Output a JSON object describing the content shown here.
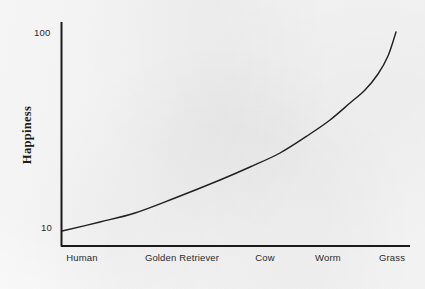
{
  "chart_data": {
    "type": "line",
    "title": "",
    "xlabel": "",
    "ylabel": "Happiness",
    "y_scale": "log",
    "ylim": [
      10,
      100
    ],
    "ytick_labels": [
      "100",
      "10"
    ],
    "ytick_values": [
      100,
      10
    ],
    "grid": false,
    "legend": false,
    "categories": [
      "Human",
      "Golden Retriever",
      "Cow",
      "Worm",
      "Grass"
    ],
    "series": [
      {
        "name": "Happiness",
        "values": [
          10,
          13,
          22,
          38,
          100
        ],
        "color": "#1f1f1f"
      }
    ],
    "curve_points": [
      {
        "x": 62,
        "y": 231
      },
      {
        "x": 100,
        "y": 222
      },
      {
        "x": 135,
        "y": 213
      },
      {
        "x": 175,
        "y": 198
      },
      {
        "x": 220,
        "y": 180
      },
      {
        "x": 250,
        "y": 167
      },
      {
        "x": 280,
        "y": 153
      },
      {
        "x": 310,
        "y": 134
      },
      {
        "x": 330,
        "y": 120
      },
      {
        "x": 350,
        "y": 103
      },
      {
        "x": 365,
        "y": 90
      },
      {
        "x": 378,
        "y": 74
      },
      {
        "x": 388,
        "y": 56
      },
      {
        "x": 396,
        "y": 32
      }
    ],
    "annotations": []
  },
  "axes": {
    "y_title": "Happiness",
    "y_ticks": [
      {
        "label": "100",
        "id": "tick-100"
      },
      {
        "label": "10",
        "id": "tick-10"
      }
    ],
    "x_ticks": [
      {
        "label": "Human",
        "x": 82
      },
      {
        "label": "Golden Retriever",
        "x": 182
      },
      {
        "label": "Cow",
        "x": 265
      },
      {
        "label": "Worm",
        "x": 328
      },
      {
        "label": "Grass",
        "x": 392
      }
    ],
    "axis_color": "#1a1a1a",
    "curve_color": "#1f1f1f",
    "background_color": "#f6f6f6"
  }
}
